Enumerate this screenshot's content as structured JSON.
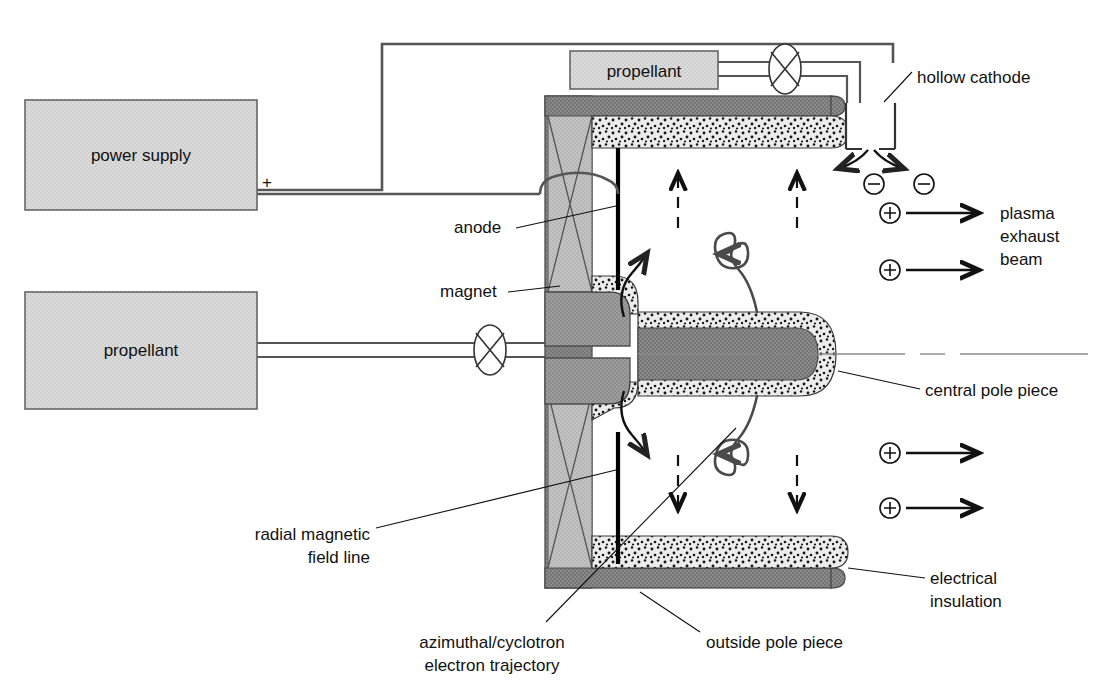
{
  "figure": {
    "background": "#ffffff"
  },
  "colors": {
    "box_fill": "#d6d6d6",
    "box_stroke": "#666666",
    "magnet_fill": "#b9b9b9",
    "pole_dark_fill": "#808080",
    "pole_mid_fill": "#a0a0a0",
    "insulation_fill": "#e8e8e8",
    "insulation_speckle": "#1a1a1a",
    "wire": "#555555",
    "text": "#111111",
    "anode_bar": "#000000",
    "trajectory": "#4a4a4a",
    "axis_line": "#8a8a8a"
  },
  "boxes": [
    {
      "id": "power-supply",
      "label": "power supply",
      "x": 25,
      "y": 100,
      "w": 232,
      "h": 110
    },
    {
      "id": "propellant-main",
      "label": "propellant",
      "x": 25,
      "y": 292,
      "w": 232,
      "h": 117
    },
    {
      "id": "propellant-cathode",
      "label": "propellant",
      "x": 570,
      "y": 51,
      "w": 148,
      "h": 38
    }
  ],
  "terminals": {
    "positive": "+"
  },
  "callouts": [
    {
      "id": "hollow-cathode",
      "text": "hollow cathode",
      "x": 917,
      "y": 77,
      "anchor": "start",
      "lines": [
        "hollow cathode"
      ]
    },
    {
      "id": "anode",
      "text": "anode",
      "x": 454,
      "y": 233,
      "anchor": "start",
      "lines": [
        "anode"
      ]
    },
    {
      "id": "magnet",
      "text": "magnet",
      "x": 440,
      "y": 296,
      "anchor": "start",
      "lines": [
        "magnet"
      ]
    },
    {
      "id": "plasma-exhaust-beam",
      "text": "plasma exhaust beam",
      "x": 1000,
      "y": 232,
      "anchor": "start",
      "lines": [
        "plasma",
        "exhaust",
        "beam"
      ]
    },
    {
      "id": "central-pole-piece",
      "text": "central pole piece",
      "x": 925,
      "y": 394,
      "anchor": "start",
      "lines": [
        "central pole piece"
      ]
    },
    {
      "id": "radial-magnetic-field-line",
      "text": "radial magnetic field line",
      "x": 370,
      "y": 540,
      "anchor": "end",
      "lines": [
        "radial magnetic",
        "field line"
      ]
    },
    {
      "id": "electrical-insulation",
      "text": "electrical insulation",
      "x": 930,
      "y": 584,
      "anchor": "start",
      "lines": [
        "electrical",
        "insulation"
      ]
    },
    {
      "id": "azimuthal-cyclotron-electron-trajectory",
      "text": "azimuthal/cyclotron electron trajectory",
      "x": 492,
      "y": 642,
      "anchor": "middle",
      "lines": [
        "azimuthal/cyclotron",
        "electron trajectory"
      ]
    },
    {
      "id": "outside-pole-piece",
      "text": "outside pole piece",
      "x": 706,
      "y": 642,
      "anchor": "start",
      "lines": [
        "outside pole piece"
      ]
    }
  ],
  "particles": [
    {
      "id": "electron-1",
      "glyph": "⊖",
      "charge": "negative",
      "x": 874,
      "y": 184
    },
    {
      "id": "electron-2",
      "glyph": "⊖",
      "charge": "negative",
      "x": 924,
      "y": 184
    },
    {
      "id": "ion-1",
      "glyph": "⊕",
      "charge": "positive",
      "x": 890,
      "y": 213
    },
    {
      "id": "ion-2",
      "glyph": "⊕",
      "charge": "positive",
      "x": 890,
      "y": 270
    },
    {
      "id": "ion-3",
      "glyph": "⊕",
      "charge": "positive",
      "x": 890,
      "y": 453
    },
    {
      "id": "ion-4",
      "glyph": "⊕",
      "charge": "positive",
      "x": 890,
      "y": 508
    }
  ],
  "icons": {
    "valve_upper": "valve-icon",
    "valve_lower": "valve-icon",
    "magnet_coil_upper": "magnet-coil-icon",
    "magnet_coil_lower": "magnet-coil-icon"
  },
  "field_arrows": {
    "up": 2,
    "down": 2,
    "note": "dashed electric-field / acceleration arrows inside the discharge channel"
  }
}
